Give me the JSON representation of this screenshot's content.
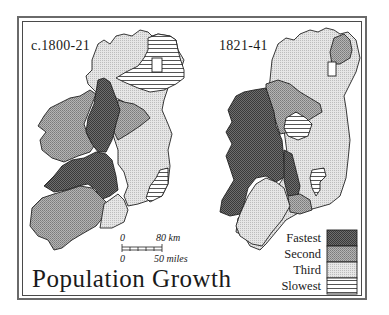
{
  "figure": {
    "title": "Population Growth",
    "maps": [
      {
        "id": "map-1800-21",
        "label": "c.1800-21"
      },
      {
        "id": "map-1821-41",
        "label": "1821-41"
      }
    ],
    "scale_bar": {
      "km_zero": "0",
      "km_value": "80 km",
      "miles_zero": "0",
      "miles_value": "50 miles"
    },
    "legend": {
      "items": [
        {
          "label": "Fastest",
          "pattern": "dark-stipple",
          "color": "#5a5a5a"
        },
        {
          "label": "Second",
          "pattern": "medium-stipple",
          "color": "#9a9a9a"
        },
        {
          "label": "Third",
          "pattern": "light-stipple",
          "color": "#d4d4d4"
        },
        {
          "label": "Slowest",
          "pattern": "horizontal-lines",
          "color": "#ffffff"
        }
      ]
    }
  }
}
